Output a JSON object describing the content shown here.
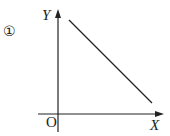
{
  "figure": {
    "index_label": "①",
    "y_axis_label": "Y",
    "x_axis_label": "X",
    "origin_label": "O"
  },
  "diagram": {
    "type": "coordinate-axes-with-line",
    "line": {
      "description": "straight line with negative slope, decreasing from upper-left to lower-right, not touching either axis"
    },
    "colors": {
      "stroke": "#222222",
      "background": "#ffffff"
    }
  }
}
